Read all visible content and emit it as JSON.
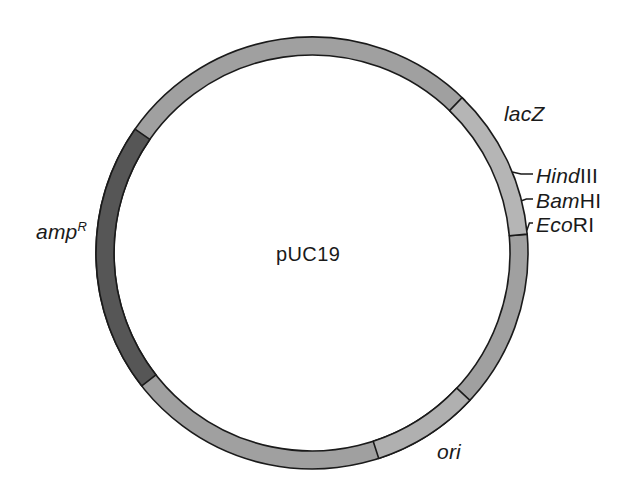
{
  "figure": {
    "kind": "plasmid-map",
    "plasmid_name": "pUC19",
    "background_color": "#ffffff",
    "outline_color": "#1a1a1a"
  },
  "geometry": {
    "center_x": 312,
    "center_y": 253,
    "outer_radius": 216,
    "ring_thickness": 18
  },
  "colors": {
    "backbone_gray": "#a0a0a0",
    "light_gray": "#b5b5b5",
    "dark_gray": "#565656",
    "stroke": "#1a1a1a"
  },
  "center_label": {
    "text": "pUC19"
  },
  "segments": [
    {
      "name": "backbone",
      "label": "",
      "fill": "#a0a0a0",
      "start_angle": -5,
      "end_angle": 315
    },
    {
      "name": "lacZ",
      "label": "lacZ",
      "fill": "#b5b5b5",
      "start_angle": -46,
      "end_angle": -5
    },
    {
      "name": "ampR",
      "label": "amp",
      "label_superscript": "R",
      "fill": "#565656",
      "start_angle": 142,
      "end_angle": 215
    },
    {
      "name": "ori",
      "label": "ori",
      "fill": "#b0b0b0",
      "start_angle": 43,
      "end_angle": 72
    }
  ],
  "labels": {
    "lacZ": "lacZ",
    "ampR_base": "amp",
    "ampR_superscript": "R",
    "ori": "ori"
  },
  "restriction_sites": [
    {
      "name": "HindIII",
      "italic_prefix": "Hind",
      "roman_suffix": "III",
      "tick_angle": -22
    },
    {
      "name": "BamHI",
      "italic_prefix": "Bam",
      "roman_suffix": "HI",
      "tick_angle": -14
    },
    {
      "name": "EcoRI",
      "italic_prefix": "Eco",
      "roman_suffix": "RI",
      "tick_angle": -6
    }
  ]
}
